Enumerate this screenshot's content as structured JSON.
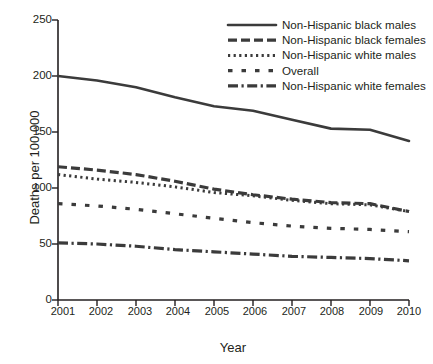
{
  "chart_data": {
    "type": "line",
    "title": "",
    "xlabel": "Year",
    "ylabel": "Deaths per 100,000",
    "x": [
      2001,
      2002,
      2003,
      2004,
      2005,
      2006,
      2007,
      2008,
      2009,
      2010
    ],
    "xtick_labels": [
      "2001",
      "2002",
      "2003",
      "2004",
      "2005",
      "2006",
      "2007",
      "2008",
      "2009",
      "2010"
    ],
    "ytick_labels": [
      "0",
      "50",
      "100",
      "150",
      "200",
      "250"
    ],
    "yticks": [
      0,
      50,
      100,
      150,
      200,
      250
    ],
    "xlim": [
      2001,
      2010
    ],
    "ylim": [
      0,
      250
    ],
    "grid": false,
    "legend_position": "top-right",
    "series": [
      {
        "name": "Non-Hispanic black males",
        "style": "solid",
        "color": "#3b3b3b",
        "values": [
          200,
          196,
          190,
          181,
          173,
          169,
          161,
          153,
          152,
          142
        ]
      },
      {
        "name": "Non-Hispanic black females",
        "style": "dashed",
        "color": "#3b3b3b",
        "values": [
          119,
          116,
          112,
          106,
          99,
          94,
          90,
          87,
          86,
          79
        ]
      },
      {
        "name": "Non-Hispanic white males",
        "style": "dotted",
        "color": "#3b3b3b",
        "values": [
          112,
          108,
          105,
          101,
          96,
          93,
          89,
          86,
          85,
          79
        ]
      },
      {
        "name": "Overall",
        "style": "dashed-wide",
        "color": "#3b3b3b",
        "values": [
          86,
          84,
          81,
          77,
          73,
          69,
          66,
          64,
          63,
          61
        ]
      },
      {
        "name": "Non-Hispanic white females",
        "style": "dash-dot",
        "color": "#3b3b3b",
        "values": [
          51,
          50,
          48,
          45,
          43,
          41,
          39,
          38,
          37,
          35
        ]
      }
    ]
  },
  "axes": {
    "y_title": "Deaths per 100,000",
    "x_title": "Year"
  },
  "footnote": {
    "text": ""
  }
}
